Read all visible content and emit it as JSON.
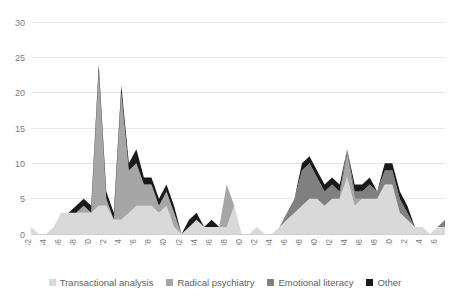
{
  "chart_data": {
    "type": "area",
    "stacked": true,
    "title": "",
    "xlabel": "",
    "ylabel": "",
    "ylim": [
      0,
      30
    ],
    "yticks": [
      0,
      5,
      10,
      15,
      20,
      25,
      30
    ],
    "grid": true,
    "legend_position": "bottom",
    "x": [
      1962,
      1963,
      1964,
      1965,
      1966,
      1967,
      1968,
      1969,
      1970,
      1971,
      1972,
      1973,
      1974,
      1975,
      1976,
      1977,
      1978,
      1979,
      1980,
      1981,
      1982,
      1983,
      1984,
      1985,
      1986,
      1987,
      1988,
      1989,
      1990,
      1991,
      1992,
      1993,
      1994,
      1995,
      1996,
      1997,
      1998,
      1999,
      2000,
      2001,
      2002,
      2003,
      2004,
      2005,
      2006,
      2007,
      2008,
      2009,
      2010,
      2011,
      2012,
      2013,
      2014,
      2015,
      2016,
      2017
    ],
    "xtick_labels": [
      "1962",
      "1964",
      "1966",
      "1968",
      "1970",
      "1972",
      "1974",
      "1976",
      "1978",
      "1980",
      "1982",
      "1984",
      "1986",
      "1988",
      "1990",
      "1992",
      "1994",
      "1996",
      "1998",
      "2000",
      "2002",
      "2004",
      "2006",
      "2008",
      "2010",
      "2012",
      "2014",
      "2016"
    ],
    "series": [
      {
        "name": "Transactional analysis",
        "color": "#d9d9d9",
        "values": [
          1,
          0,
          0,
          1,
          3,
          3,
          3,
          3,
          3,
          4,
          4,
          2,
          2,
          3,
          4,
          4,
          4,
          3,
          4,
          1,
          0,
          1,
          2,
          1,
          1,
          1,
          1,
          4,
          0,
          0,
          1,
          0,
          0,
          1,
          2,
          3,
          4,
          5,
          5,
          4,
          5,
          5,
          8,
          4,
          5,
          5,
          5,
          7,
          7,
          3,
          2,
          1,
          1,
          0,
          1,
          1
        ]
      },
      {
        "name": "Radical psychiatry",
        "color": "#a6a6a6",
        "values": [
          0,
          0,
          0,
          0,
          0,
          0,
          0,
          1,
          0,
          19,
          1,
          0,
          18,
          6,
          6,
          3,
          3,
          1,
          2,
          2,
          0,
          0,
          0,
          0,
          0,
          0,
          6,
          0,
          0,
          0,
          0,
          0,
          0,
          0,
          0,
          0,
          0,
          0,
          0,
          0,
          0,
          0,
          3,
          1,
          0,
          0,
          0,
          0,
          0,
          0,
          0,
          0,
          0,
          0,
          0,
          0
        ]
      },
      {
        "name": "Emotional literacy",
        "color": "#808080",
        "values": [
          0,
          0,
          0,
          0,
          0,
          0,
          0,
          0,
          0,
          0,
          0,
          0,
          0,
          0,
          0,
          0,
          0,
          0,
          0,
          0,
          0,
          0,
          0,
          0,
          0,
          0,
          0,
          0,
          0,
          0,
          0,
          0,
          0,
          0,
          1,
          2,
          5,
          5,
          3,
          2,
          2,
          1,
          1,
          1,
          1,
          2,
          1,
          2,
          2,
          2,
          1,
          0,
          0,
          0,
          0,
          1
        ]
      },
      {
        "name": "Other",
        "color": "#1a1a1a",
        "values": [
          0,
          0,
          0,
          0,
          0,
          0,
          1,
          1,
          1,
          1,
          1,
          1,
          1,
          1,
          2,
          1,
          1,
          1,
          1,
          1,
          0,
          1,
          1,
          0,
          1,
          0,
          0,
          0,
          0,
          0,
          0,
          0,
          0,
          0,
          0,
          0,
          1,
          1,
          1,
          1,
          1,
          1,
          0,
          1,
          1,
          1,
          0,
          1,
          1,
          1,
          1,
          0,
          0,
          0,
          0,
          0
        ]
      }
    ]
  },
  "legend": {
    "items": [
      {
        "label": "Transactional analysis",
        "color": "#d9d9d9"
      },
      {
        "label": "Radical psychiatry",
        "color": "#a6a6a6"
      },
      {
        "label": "Emotional literacy",
        "color": "#808080"
      },
      {
        "label": "Other",
        "color": "#1a1a1a"
      }
    ]
  }
}
